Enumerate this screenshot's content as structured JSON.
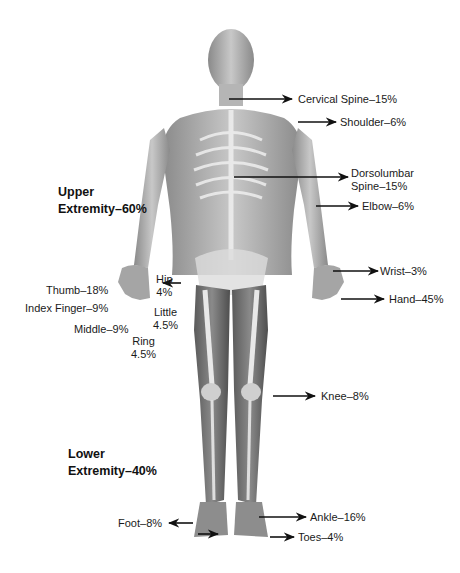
{
  "diagram": {
    "type": "anatomical-impairment-percentages",
    "regions": {
      "upper": {
        "label": "Upper\nExtremity–60%"
      },
      "lower": {
        "label": "Lower\nExtremity–40%"
      }
    },
    "labels": {
      "cervical_spine": "Cervical Spine–15%",
      "shoulder": "Shoulder–6%",
      "dorsolumbar_spine": "Dorsolumbar\nSpine–15%",
      "elbow": "Elbow–6%",
      "wrist": "Wrist–3%",
      "hand": "Hand–45%",
      "thumb": "Thumb–18%",
      "index_finger": "Index Finger–9%",
      "middle": "Middle–9%",
      "ring": "Ring\n4.5%",
      "little": "Little\n4.5%",
      "hip": "Hip\n4%",
      "knee": "Knee–8%",
      "ankle": "Ankle–16%",
      "foot": "Foot–8%",
      "toes": "Toes–4%"
    },
    "colors": {
      "skin_light": "#d9d9d9",
      "skin_dark": "#6e6e6e",
      "bone": "#eeeeee",
      "arrow": "#111111",
      "text": "#1a1a1a"
    }
  }
}
